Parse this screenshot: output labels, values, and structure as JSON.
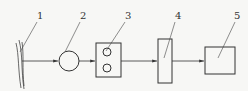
{
  "diagram": {
    "type": "block-flow",
    "labels": [
      {
        "id": "1",
        "text": "1"
      },
      {
        "id": "2",
        "text": "2"
      },
      {
        "id": "3",
        "text": "3"
      },
      {
        "id": "4",
        "text": "4"
      },
      {
        "id": "5",
        "text": "5"
      }
    ],
    "components": [
      {
        "label": "1",
        "shape": "wavy-vertical-lines"
      },
      {
        "label": "2",
        "shape": "circle"
      },
      {
        "label": "3",
        "shape": "rectangle-with-two-circles"
      },
      {
        "label": "4",
        "shape": "tall-narrow-rectangle"
      },
      {
        "label": "5",
        "shape": "rectangle"
      }
    ],
    "connections": [
      {
        "from": "1",
        "to": "2"
      },
      {
        "from": "2",
        "to": "3"
      },
      {
        "from": "3",
        "to": "4"
      },
      {
        "from": "4",
        "to": "5"
      }
    ],
    "line_color": "#333333"
  }
}
